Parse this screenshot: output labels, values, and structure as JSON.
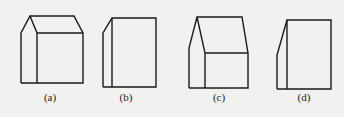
{
  "figures": [
    {
      "id": "a",
      "label": "(a)",
      "description": "house-shaped prism with pitched roof, shown in oblique view with side and front faces"
    },
    {
      "id": "b",
      "label": "(b)",
      "description": "rectangular block with narrow slanted left side face"
    },
    {
      "id": "c",
      "label": "(c)",
      "description": "house-shaped prism with pitched roof, alternate view"
    },
    {
      "id": "d",
      "label": "(d)",
      "description": "rectangular block with narrow slanted left side face, alternate view"
    }
  ],
  "colors": {
    "background": "#f1f1ef",
    "stroke": "#1a1a1a"
  }
}
